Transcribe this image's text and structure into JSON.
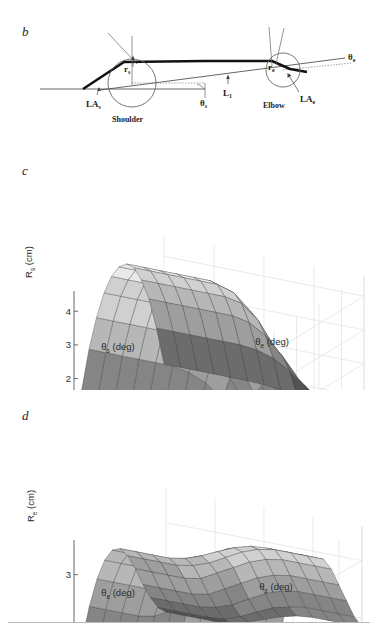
{
  "figure": {
    "panels": [
      {
        "id": "b",
        "label": "b"
      },
      {
        "id": "c",
        "label": "c"
      },
      {
        "id": "d",
        "label": "d"
      }
    ]
  },
  "diagram": {
    "name": "arm-linkage-moment-arm-diagram",
    "labels": {
      "r_s": {
        "base": "r",
        "sub": "s"
      },
      "r_e": {
        "base": "r",
        "sub": "e"
      },
      "LA_s": {
        "base": "LA",
        "sub": "s"
      },
      "LA_e": {
        "base": "LA",
        "sub": "e"
      },
      "theta_s": {
        "base": "θ",
        "sub": "s"
      },
      "theta_e": {
        "base": "θ",
        "sub": "e"
      },
      "L_1": {
        "base": "L",
        "sub": "1"
      },
      "shoulder": "Shoulder",
      "elbow": "Elbow"
    }
  },
  "chart_data": [
    {
      "panel": "c",
      "type": "surface",
      "title": "",
      "zlabel": {
        "base": "R",
        "sub": "s",
        "unit": "(cm)"
      },
      "xlabel": {
        "base": "θ",
        "sub": "s",
        "unit": "(deg)"
      },
      "ylabel": {
        "base": "θ",
        "sub": "e",
        "unit": "(deg)"
      },
      "zticks": [
        0,
        1,
        2,
        3,
        4
      ],
      "zlim": [
        0,
        4.6
      ],
      "xticks": [
        150,
        100,
        50,
        0
      ],
      "xlim": [
        0,
        160
      ],
      "yticks": [
        150,
        100,
        50,
        0
      ],
      "ylim": [
        0,
        160
      ],
      "grid": true,
      "legend": "none",
      "colormap": "gray",
      "annotation": "Shoulder moment arm R_s rises from ~0 cm at low shoulder angle to a ~4.5 cm plateau ridge, then falls to a low flat shelf at high theta_e.",
      "surface_z": [
        [
          0.0,
          0.0,
          0.0,
          0.0,
          0.0,
          0.0,
          0.0,
          0.0,
          0.0,
          0.0,
          0.0,
          0.0,
          0.0
        ],
        [
          1.5,
          1.5,
          1.5,
          1.5,
          1.5,
          1.5,
          1.5,
          1.4,
          1.2,
          0.9,
          0.7,
          0.6,
          0.6
        ],
        [
          2.6,
          2.6,
          2.6,
          2.6,
          2.6,
          2.6,
          2.5,
          2.3,
          1.9,
          1.4,
          1.0,
          0.8,
          0.8
        ],
        [
          3.4,
          3.4,
          3.4,
          3.4,
          3.4,
          3.4,
          3.3,
          3.0,
          2.4,
          1.7,
          1.2,
          1.0,
          1.0
        ],
        [
          4.0,
          4.0,
          4.0,
          4.0,
          4.0,
          4.0,
          3.9,
          3.5,
          2.8,
          1.9,
          1.3,
          1.1,
          1.1
        ],
        [
          4.35,
          4.35,
          4.35,
          4.35,
          4.35,
          4.35,
          4.2,
          3.8,
          3.0,
          2.0,
          1.4,
          1.15,
          1.15
        ],
        [
          4.5,
          4.5,
          4.5,
          4.5,
          4.5,
          4.5,
          4.35,
          3.9,
          3.1,
          2.05,
          1.42,
          1.18,
          1.18
        ],
        [
          4.45,
          4.45,
          4.45,
          4.45,
          4.45,
          4.45,
          4.3,
          3.85,
          3.05,
          2.0,
          1.4,
          1.16,
          1.16
        ],
        [
          4.2,
          4.2,
          4.2,
          4.2,
          4.2,
          4.2,
          4.05,
          3.6,
          2.85,
          1.9,
          1.3,
          1.1,
          1.1
        ],
        [
          3.7,
          3.7,
          3.7,
          3.7,
          3.7,
          3.7,
          3.6,
          3.2,
          2.5,
          1.7,
          1.2,
          1.0,
          1.0
        ],
        [
          3.0,
          3.0,
          3.0,
          3.0,
          3.0,
          3.0,
          2.9,
          2.6,
          2.1,
          1.5,
          1.1,
          0.9,
          0.9
        ],
        [
          2.0,
          2.0,
          2.0,
          2.0,
          2.0,
          2.0,
          1.95,
          1.8,
          1.5,
          1.1,
          0.85,
          0.75,
          0.75
        ],
        [
          0.8,
          0.8,
          0.8,
          0.8,
          0.8,
          0.8,
          0.78,
          0.72,
          0.62,
          0.5,
          0.42,
          0.4,
          0.4
        ]
      ]
    },
    {
      "panel": "d",
      "type": "surface",
      "title": "",
      "zlabel": {
        "base": "R",
        "sub": "e",
        "unit": "(cm)"
      },
      "xlabel": {
        "base": "θ",
        "sub": "e",
        "unit": "(deg)"
      },
      "ylabel": {
        "base": "θ",
        "sub": "s",
        "unit": "(deg)"
      },
      "zticks": [
        1,
        2,
        3
      ],
      "zlim": [
        1,
        3.6
      ],
      "xticks": [
        150,
        100,
        50,
        0
      ],
      "xlim": [
        0,
        160
      ],
      "yticks": [
        0,
        50,
        100,
        150
      ],
      "ylim": [
        0,
        160
      ],
      "grid": true,
      "legend": "none",
      "colormap": "gray",
      "annotation": "Elbow moment arm R_e rises from 1 cm to a broad ~3.4 cm ridge then drops to a ~2.7 cm plateau.",
      "surface_z": [
        [
          1.0,
          1.0,
          1.0,
          1.0,
          1.0,
          1.0,
          1.0,
          1.0,
          1.0,
          1.0,
          1.0,
          1.0,
          1.0
        ],
        [
          1.75,
          1.75,
          1.75,
          1.75,
          1.8,
          1.9,
          2.0,
          2.1,
          2.15,
          2.2,
          2.2,
          2.2,
          2.2
        ],
        [
          2.3,
          2.3,
          2.3,
          2.3,
          2.35,
          2.5,
          2.65,
          2.8,
          2.9,
          2.95,
          2.95,
          2.95,
          2.95
        ],
        [
          2.7,
          2.7,
          2.7,
          2.7,
          2.75,
          2.9,
          3.05,
          3.2,
          3.3,
          3.35,
          3.35,
          3.35,
          3.35
        ],
        [
          2.95,
          2.95,
          2.95,
          2.95,
          3.0,
          3.1,
          3.25,
          3.4,
          3.45,
          3.5,
          3.5,
          3.5,
          3.5
        ],
        [
          3.05,
          3.05,
          3.05,
          3.05,
          3.1,
          3.2,
          3.3,
          3.45,
          3.5,
          3.55,
          3.55,
          3.55,
          3.55
        ],
        [
          3.0,
          3.0,
          3.0,
          3.0,
          3.05,
          3.15,
          3.28,
          3.4,
          3.48,
          3.5,
          3.5,
          3.5,
          3.5
        ],
        [
          2.8,
          2.8,
          2.8,
          2.8,
          2.85,
          2.95,
          3.1,
          3.25,
          3.35,
          3.4,
          3.4,
          3.4,
          3.4
        ],
        [
          2.5,
          2.5,
          2.5,
          2.5,
          2.55,
          2.7,
          2.85,
          3.0,
          3.1,
          3.15,
          3.15,
          3.15,
          3.15
        ],
        [
          2.15,
          2.15,
          2.15,
          2.15,
          2.2,
          2.35,
          2.5,
          2.65,
          2.75,
          2.8,
          2.8,
          2.8,
          2.8
        ],
        [
          1.85,
          1.85,
          1.85,
          1.85,
          1.9,
          2.0,
          2.15,
          2.3,
          2.4,
          2.45,
          2.45,
          2.45,
          2.45
        ],
        [
          1.6,
          1.6,
          1.6,
          1.6,
          1.62,
          1.72,
          1.85,
          1.98,
          2.05,
          2.1,
          2.1,
          2.1,
          2.1
        ],
        [
          1.45,
          1.45,
          1.45,
          1.45,
          1.47,
          1.55,
          1.65,
          1.75,
          1.82,
          1.85,
          1.85,
          1.85,
          1.85
        ]
      ]
    }
  ]
}
